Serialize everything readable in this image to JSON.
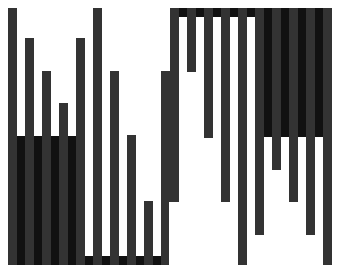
{
  "colors": {
    "background": "#ffffff",
    "bar": "#333333",
    "fill": "#111111"
  },
  "rects": [
    {
      "x": 8,
      "y": 8,
      "w": 9,
      "h": 257,
      "c": "bar"
    },
    {
      "x": 25,
      "y": 38,
      "w": 9,
      "h": 227,
      "c": "bar"
    },
    {
      "x": 42,
      "y": 71,
      "w": 9,
      "h": 194,
      "c": "bar"
    },
    {
      "x": 59,
      "y": 103,
      "w": 9,
      "h": 162,
      "c": "bar"
    },
    {
      "x": 76,
      "y": 38,
      "w": 9,
      "h": 227,
      "c": "bar"
    },
    {
      "x": 17,
      "y": 136,
      "w": 8,
      "h": 129,
      "c": "fill"
    },
    {
      "x": 34,
      "y": 136,
      "w": 8,
      "h": 129,
      "c": "fill"
    },
    {
      "x": 51,
      "y": 136,
      "w": 8,
      "h": 129,
      "c": "fill"
    },
    {
      "x": 68,
      "y": 136,
      "w": 8,
      "h": 129,
      "c": "fill"
    },
    {
      "x": 93,
      "y": 8,
      "w": 9,
      "h": 257,
      "c": "bar"
    },
    {
      "x": 110,
      "y": 71,
      "w": 9,
      "h": 194,
      "c": "bar"
    },
    {
      "x": 127,
      "y": 135,
      "w": 9,
      "h": 130,
      "c": "bar"
    },
    {
      "x": 144,
      "y": 201,
      "w": 9,
      "h": 64,
      "c": "bar"
    },
    {
      "x": 85,
      "y": 256,
      "w": 8,
      "h": 9,
      "c": "fill"
    },
    {
      "x": 102,
      "y": 256,
      "w": 8,
      "h": 9,
      "c": "fill"
    },
    {
      "x": 119,
      "y": 256,
      "w": 8,
      "h": 9,
      "c": "fill"
    },
    {
      "x": 136,
      "y": 256,
      "w": 8,
      "h": 9,
      "c": "fill"
    },
    {
      "x": 153,
      "y": 256,
      "w": 8,
      "h": 9,
      "c": "fill"
    },
    {
      "x": 161,
      "y": 71,
      "w": 17,
      "h": 131,
      "c": "bar"
    },
    {
      "x": 161,
      "y": 202,
      "w": 8,
      "h": 63,
      "c": "bar"
    },
    {
      "x": 170,
      "y": 8,
      "w": 9,
      "h": 194,
      "c": "bar"
    },
    {
      "x": 187,
      "y": 8,
      "w": 9,
      "h": 64,
      "c": "bar"
    },
    {
      "x": 204,
      "y": 8,
      "w": 9,
      "h": 130,
      "c": "bar"
    },
    {
      "x": 221,
      "y": 8,
      "w": 9,
      "h": 194,
      "c": "bar"
    },
    {
      "x": 238,
      "y": 8,
      "w": 9,
      "h": 257,
      "c": "bar"
    },
    {
      "x": 179,
      "y": 8,
      "w": 8,
      "h": 9,
      "c": "fill"
    },
    {
      "x": 196,
      "y": 8,
      "w": 8,
      "h": 9,
      "c": "fill"
    },
    {
      "x": 213,
      "y": 8,
      "w": 8,
      "h": 9,
      "c": "fill"
    },
    {
      "x": 230,
      "y": 8,
      "w": 8,
      "h": 9,
      "c": "fill"
    },
    {
      "x": 247,
      "y": 8,
      "w": 8,
      "h": 9,
      "c": "fill"
    },
    {
      "x": 255,
      "y": 8,
      "w": 9,
      "h": 227,
      "c": "bar"
    },
    {
      "x": 272,
      "y": 8,
      "w": 9,
      "h": 162,
      "c": "bar"
    },
    {
      "x": 289,
      "y": 8,
      "w": 9,
      "h": 194,
      "c": "bar"
    },
    {
      "x": 306,
      "y": 8,
      "w": 9,
      "h": 227,
      "c": "bar"
    },
    {
      "x": 323,
      "y": 8,
      "w": 9,
      "h": 257,
      "c": "bar"
    },
    {
      "x": 264,
      "y": 8,
      "w": 8,
      "h": 129,
      "c": "fill"
    },
    {
      "x": 281,
      "y": 8,
      "w": 8,
      "h": 129,
      "c": "fill"
    },
    {
      "x": 298,
      "y": 8,
      "w": 8,
      "h": 129,
      "c": "fill"
    },
    {
      "x": 315,
      "y": 8,
      "w": 8,
      "h": 129,
      "c": "fill"
    }
  ]
}
